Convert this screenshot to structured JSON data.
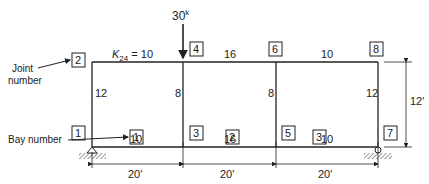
{
  "load": {
    "label": "30",
    "unit": "k"
  },
  "stiffness_label": {
    "prefix": "K",
    "sub": "24",
    "suffix": " = 10"
  },
  "annotations": {
    "joint_number": [
      "Joint",
      "number"
    ],
    "bay_number": "Bay number"
  },
  "joints": [
    "1",
    "2",
    "3",
    "4",
    "5",
    "6",
    "7",
    "8"
  ],
  "top_beams": [
    "16",
    "10"
  ],
  "bottom_beams": [
    "10",
    "16",
    "10"
  ],
  "columns": [
    "12",
    "8",
    "8",
    "12"
  ],
  "bays": [
    "1",
    "2",
    "3"
  ],
  "spans": [
    "20'",
    "20'",
    "20'"
  ],
  "height": "12'"
}
